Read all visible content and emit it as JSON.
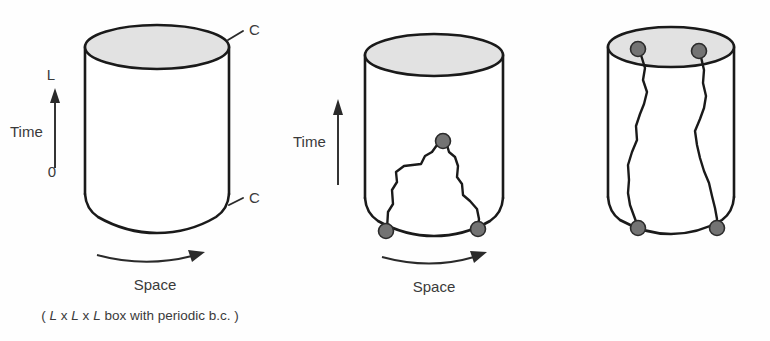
{
  "figure": {
    "background_color": "#fefefe",
    "ink_color": "#1a1a1a",
    "dot_fill_color": "#737373",
    "top_face_color": "#e2e2e2",
    "caption": {
      "open_paren": "(",
      "dim_l1": "L",
      "x1": "x",
      "dim_l2": "L",
      "x2": "x",
      "dim_l3": "L",
      "rest": " box with periodic b.c. ",
      "close_paren": ")",
      "full_text": "( LxLxL box with periodic b.c. )"
    },
    "panels": [
      {
        "id": "panel-empty-cylinder",
        "name": "empty-spacetime-cylinder",
        "time_label": "Time",
        "space_label": "Space",
        "time_top_tick_label": "L",
        "time_bottom_tick_label": "0",
        "boundary_label_top": "C",
        "boundary_label_bottom": "C",
        "worldline_count": 0,
        "dot_count": 0
      },
      {
        "id": "panel-single-loop",
        "name": "single-closed-loop-cylinder",
        "time_label": "Time",
        "space_label": "Space",
        "worldline_count": 1,
        "dot_count": 3,
        "loop_description": "closed worldline loop touching bottom boundary at two points with an apex vertex"
      },
      {
        "id": "panel-two-winding-lines",
        "name": "two-winding-worldlines-cylinder",
        "worldline_count": 2,
        "dot_count": 4,
        "loop_description": "two worldlines winding from top face to bottom boundary"
      }
    ]
  }
}
